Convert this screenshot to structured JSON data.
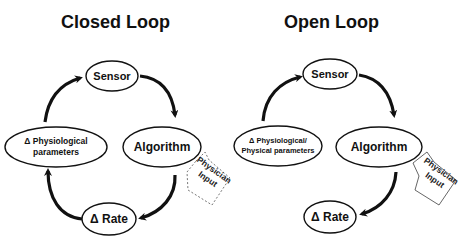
{
  "panels": [
    {
      "title": "Closed Loop",
      "nodes": {
        "sensor": "Sensor",
        "algorithm": "Algorithm",
        "rate": "Δ Rate",
        "params_line1": "Δ Physiological",
        "params_line2": "parameters"
      },
      "callout": {
        "line1": "Physician",
        "line2": "Input",
        "style": "dashed"
      }
    },
    {
      "title": "Open Loop",
      "nodes": {
        "sensor": "Sensor",
        "algorithm": "Algorithm",
        "rate": "Δ Rate",
        "params_line1": "Δ Physiological/",
        "params_line2": "Physical parameters"
      },
      "callout": {
        "line1": "Physician",
        "line2": "Input",
        "style": "solid"
      }
    }
  ],
  "colors": {
    "stroke": "#111111",
    "callout": "#555555",
    "background": "#ffffff"
  }
}
